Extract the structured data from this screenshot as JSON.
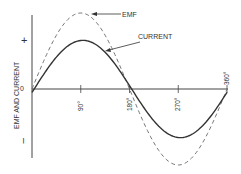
{
  "diagram": {
    "y_axis_label": "EMF AND CURRENT",
    "plus_sign": "+",
    "minus_sign": "–",
    "origin_label": "0",
    "x_ticks": [
      "90°",
      "180°",
      "270°",
      "360°"
    ],
    "curves": [
      {
        "name": "EMF",
        "label": "EMF",
        "style": "dashed",
        "relative_amplitude": 1.0,
        "phase_lag_deg": 0
      },
      {
        "name": "CURRENT",
        "label": "CURRENT",
        "style": "solid",
        "relative_amplitude": 0.64,
        "phase_lag_deg": 4
      }
    ],
    "colors": {
      "line": "#333333",
      "dashed": "#777777"
    }
  }
}
